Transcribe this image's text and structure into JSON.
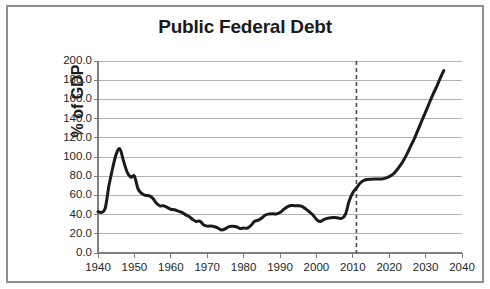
{
  "figure": {
    "title": "Public Federal Debt",
    "border_color": "#8f8f8f",
    "background": "#ffffff"
  },
  "chart_data": {
    "type": "line",
    "title": "Public Federal Debt",
    "xlabel": "",
    "ylabel": "% of GDP",
    "xlim": [
      1940,
      2040
    ],
    "ylim": [
      0,
      200
    ],
    "grid": true,
    "legend": false,
    "line_color": "#1a1a1a",
    "line_width_px": 3,
    "x_ticks": [
      1940,
      1950,
      1960,
      1970,
      1980,
      1990,
      2000,
      2010,
      2020,
      2030,
      2040
    ],
    "x_tick_labels": [
      "1940",
      "1950",
      "1960",
      "1970",
      "1980",
      "1990",
      "2000",
      "2010",
      "2020",
      "2030",
      "2040"
    ],
    "y_ticks": [
      0,
      20,
      40,
      60,
      80,
      100,
      120,
      140,
      160,
      180,
      200
    ],
    "y_tick_labels": [
      "0.0",
      "20.0",
      "40.0",
      "60.0",
      "80.0",
      "100.0",
      "120.0",
      "140.0",
      "160.0",
      "180.0",
      "200.0"
    ],
    "annotations": [
      {
        "type": "vertical-dashed-line",
        "x": 2011,
        "label": "",
        "color": "#4d4d4d",
        "dash": "4,3",
        "note": "divides historical data from projection"
      }
    ],
    "series": [
      {
        "name": "Public Federal Debt (% of GDP)",
        "x": [
          1940,
          1941,
          1942,
          1943,
          1944,
          1945,
          1946,
          1947,
          1948,
          1949,
          1950,
          1951,
          1952,
          1953,
          1954,
          1955,
          1956,
          1957,
          1958,
          1959,
          1960,
          1961,
          1962,
          1963,
          1964,
          1965,
          1966,
          1967,
          1968,
          1969,
          1970,
          1971,
          1972,
          1973,
          1974,
          1975,
          1976,
          1977,
          1978,
          1979,
          1980,
          1981,
          1982,
          1983,
          1984,
          1985,
          1986,
          1987,
          1988,
          1989,
          1990,
          1991,
          1992,
          1993,
          1994,
          1995,
          1996,
          1997,
          1998,
          1999,
          2000,
          2001,
          2002,
          2003,
          2004,
          2005,
          2006,
          2007,
          2008,
          2009,
          2010,
          2011,
          2012,
          2013,
          2014,
          2015,
          2016,
          2017,
          2018,
          2019,
          2020,
          2021,
          2022,
          2023,
          2024,
          2025,
          2026,
          2027,
          2028,
          2029,
          2030,
          2031,
          2032,
          2033,
          2034,
          2035
        ],
        "values": [
          43.0,
          42.3,
          47.0,
          70.0,
          88.0,
          103.0,
          108.6,
          96.0,
          84.3,
          79.0,
          80.1,
          66.8,
          62.1,
          60.0,
          59.6,
          57.2,
          52.0,
          49.1,
          49.2,
          47.5,
          45.6,
          45.0,
          43.7,
          42.4,
          40.0,
          38.0,
          35.0,
          32.8,
          33.3,
          29.3,
          28.0,
          28.1,
          27.4,
          26.0,
          23.9,
          25.3,
          27.5,
          27.8,
          27.4,
          25.6,
          26.1,
          25.8,
          28.6,
          33.1,
          34.0,
          36.4,
          39.6,
          40.6,
          40.9,
          40.6,
          42.1,
          45.3,
          48.1,
          49.4,
          49.3,
          49.2,
          48.5,
          46.1,
          43.0,
          39.8,
          35.1,
          32.7,
          34.7,
          36.1,
          36.8,
          36.9,
          36.5,
          36.2,
          40.5,
          54.1,
          62.8,
          67.7,
          72.6,
          75.5,
          76.6,
          76.9,
          77.1,
          77.0,
          77.2,
          78.0,
          79.5,
          82.0,
          86.0,
          91.0,
          97.0,
          104.0,
          112.0,
          120.0,
          129.0,
          138.0,
          147.0,
          156.0,
          165.0,
          173.0,
          182.0,
          190.0
        ]
      }
    ]
  },
  "axes": {
    "y_title": "% of GDP"
  }
}
